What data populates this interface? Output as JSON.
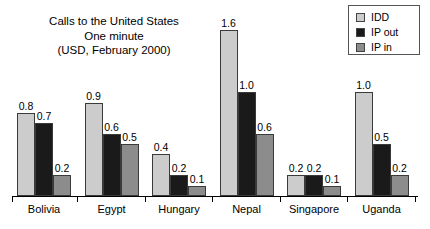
{
  "chart_data": {
    "type": "bar",
    "title": "Calls to the United States One minute (USD, February 2000)",
    "title_lines": [
      "Calls to the United States",
      "One minute",
      "(USD, February 2000)"
    ],
    "xlabel": "",
    "ylabel": "",
    "ylim": [
      0,
      1.6
    ],
    "grid": false,
    "legend_position": "top-right",
    "categories": [
      "Bolivia",
      "Egypt",
      "Hungary",
      "Nepal",
      "Singapore",
      "Uganda"
    ],
    "series": [
      {
        "name": "IDD",
        "color": "#cccccc",
        "values": [
          0.8,
          0.9,
          0.4,
          1.6,
          0.2,
          1.0
        ],
        "labels": [
          "0.8",
          "0.9",
          "0.4",
          "1.6",
          "0.2",
          "1.0"
        ]
      },
      {
        "name": "IP out",
        "color": "#1a1a1a",
        "values": [
          0.7,
          0.6,
          0.2,
          1.0,
          0.2,
          0.5
        ],
        "labels": [
          "0.7",
          "0.6",
          "0.2",
          "1.0",
          "0.2",
          "0.5"
        ]
      },
      {
        "name": "IP in",
        "color": "#8c8c8c",
        "values": [
          0.2,
          0.5,
          0.1,
          0.6,
          0.1,
          0.2
        ],
        "labels": [
          "0.2",
          "0.5",
          "0.1",
          "0.6",
          "0.1",
          "0.2"
        ]
      }
    ]
  },
  "legend": {
    "items": [
      {
        "label": "IDD",
        "color": "#cccccc"
      },
      {
        "label": "IP out",
        "color": "#1a1a1a"
      },
      {
        "label": "IP in",
        "color": "#8c8c8c"
      }
    ]
  }
}
